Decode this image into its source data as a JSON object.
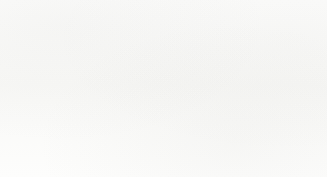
{
  "figure": {
    "background_color": "#fbfbfa",
    "ink_color": "#14100f"
  },
  "diagram": {
    "type": "nested-brace-syntax-diagram",
    "outer_brace_open": "{",
    "outer_brace_close": "}",
    "groups": [
      {
        "id": "operation",
        "name": "operation-group",
        "items": [
          "LoaD",
          "STore"
        ]
      },
      {
        "id": "signedness",
        "name": "signedness-group",
        "items": [
          "Signed",
          "Unsigned"
        ]
      },
      {
        "id": "size",
        "name": "data-size-group",
        "items": [
          "Byte",
          "Halfword",
          "word",
          "Double word"
        ]
      },
      {
        "id": "asi",
        "name": "address-space-group",
        "items": [
          "normal",
          "Alternate"
        ]
      },
      {
        "id": "precision",
        "name": "precision-group",
        "items": [
          "single",
          "Double"
        ]
      },
      {
        "id": "unit",
        "name": "functional-unit-group",
        "items": [
          "Floating−point",
          "Coprocessor"
        ]
      },
      {
        "id": "destination",
        "name": "destination-group",
        "items": [
          "register",
          "Status Register",
          "Queue"
        ]
      }
    ]
  }
}
